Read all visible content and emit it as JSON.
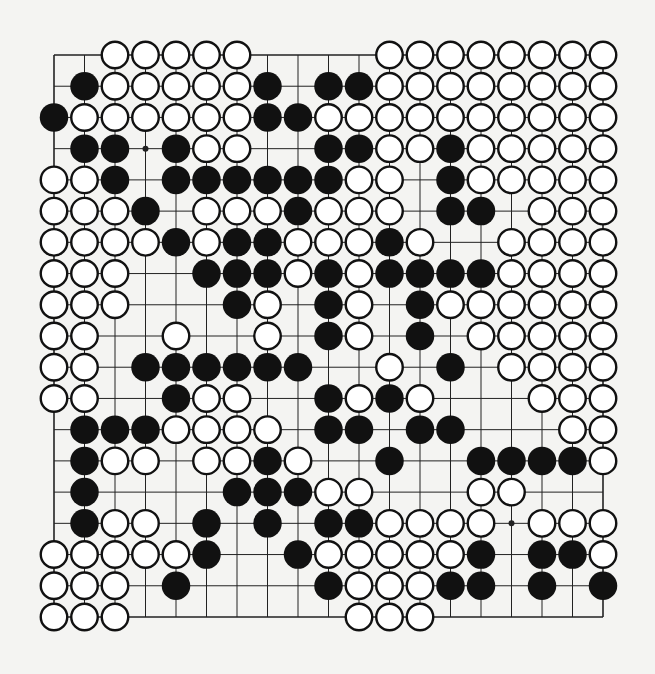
{
  "game": "Go",
  "board": {
    "size": 19,
    "legend": {
      "B": "black",
      "W": "white",
      ".": "empty"
    },
    "colors": {
      "background": "#f4f4f2",
      "line": "#222222",
      "black_stone": "#111111",
      "white_stone": "#ffffff",
      "stone_outline": "#111111"
    },
    "hoshi": [
      [
        3,
        3
      ],
      [
        9,
        3
      ],
      [
        15,
        15
      ]
    ],
    "rows": [
      "..WWWWW....WWWWWWWW",
      ".BWWWWWB.BBWWWWWWWW",
      "BWWWWWWBBWWWWWWWWWW",
      ".BB.BWW..BBWWBWWWWW",
      "WWB.BBBBBBWW.BWWWWW",
      "WWWB.WWWBWWW.BB.WWW",
      "WWWWBWBBWWWBW..WWWW",
      "WWW..BBBWBWBBBBWWWW",
      "WWW...BW.BW.BWWWWWW",
      "WW..W..W.BW.B.WWWWW",
      "WW.BBBBBB..W.B.WWWW",
      "WW..BWW..BWBW...WWW",
      ".BBBWWWW.BB.BB...WW",
      ".BWW.WWBW..B..BBBBW",
      ".B....BBBWW...WW...",
      ".BWW.B.B.BBWWWW.WWW",
      "WWWWWB..BWWWWWB.BBW",
      "WWW.B....BWWWBB.B.B",
      "WWW.......WWW......"
    ]
  }
}
